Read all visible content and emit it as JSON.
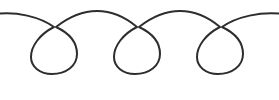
{
  "canvas": {
    "width": 279,
    "height": 100,
    "background_color": "#ffffff",
    "title": "Looping flourish divider ornament"
  },
  "artwork": {
    "name": "three-loop-flourish",
    "description": "Continuous hand-drawn line forming three teardrop loops joined by upward arcs",
    "stroke_color": "#2e2d2d",
    "stroke_width": 2,
    "fill": "none",
    "loop_count": 3,
    "path": "M -4 14 C 16 11 40 17 54 27 C 40 34 31 46 31 57 C 31 67 40 74 52 74 C 66 74 77 66 77 54 C 77 42 69 33 56 27 C 70 16 84 11 97 11 C 110 11 124 16 137 27 C 123 34 114 46 114 57 C 114 67 123 74 135 74 C 149 74 160 66 160 54 C 160 42 152 33 139 27 C 153 16 167 11 180 11 C 193 11 207 16 220 27 C 206 34 197 46 197 57 C 197 67 206 74 218 74 C 232 74 243 66 243 54 C 243 42 235 33 222 27 C 236 17 261 11 283 14",
    "crossings": [
      {
        "x": 56,
        "y": 27
      },
      {
        "x": 139,
        "y": 27
      },
      {
        "x": 222,
        "y": 27
      }
    ],
    "arc_apexes": [
      {
        "x": 97,
        "y": 11
      },
      {
        "x": 180,
        "y": 11
      }
    ],
    "loop_bottom_y": 73,
    "loops": [
      {
        "center_x": 54,
        "left_x": 31,
        "right_x": 77,
        "top_y": 27,
        "bottom_y": 74
      },
      {
        "center_x": 137,
        "left_x": 114,
        "right_x": 160,
        "top_y": 27,
        "bottom_y": 74
      },
      {
        "center_x": 220,
        "left_x": 197,
        "right_x": 243,
        "top_y": 27,
        "bottom_y": 74
      }
    ]
  }
}
